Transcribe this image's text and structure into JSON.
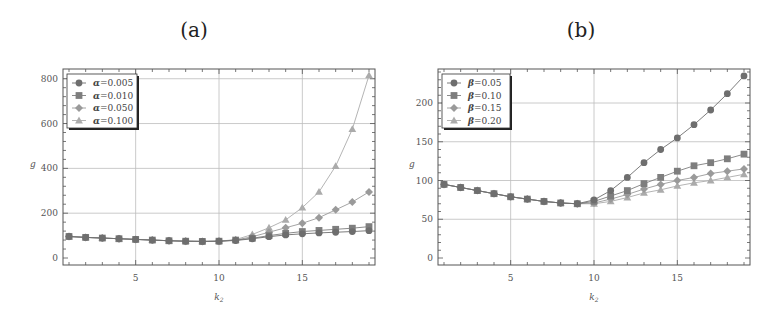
{
  "panels": [
    {
      "label": "(a)"
    },
    {
      "label": "(b)"
    }
  ],
  "chart_data": [
    {
      "type": "line",
      "title": "(a)",
      "xlabel": "k2",
      "ylabel": "g",
      "xlim": [
        1,
        19
      ],
      "ylim": [
        0,
        830
      ],
      "xticks": [
        5,
        10,
        15
      ],
      "yticks": [
        0,
        200,
        400,
        600,
        800
      ],
      "grid": true,
      "legend_position": "top-left",
      "x": [
        1,
        2,
        3,
        4,
        5,
        6,
        7,
        8,
        9,
        10,
        11,
        12,
        13,
        14,
        15,
        16,
        17,
        18,
        19
      ],
      "series": [
        {
          "name": "α=0.005",
          "marker": "circle",
          "values": [
            96,
            92,
            89,
            86,
            83,
            80,
            77,
            75,
            74,
            75,
            78,
            86,
            95,
            103,
            108,
            112,
            115,
            118,
            122
          ]
        },
        {
          "name": "α=0.010",
          "marker": "square",
          "values": [
            96,
            92,
            89,
            86,
            83,
            80,
            77,
            75,
            74,
            75,
            80,
            88,
            100,
            110,
            118,
            123,
            128,
            133,
            140
          ]
        },
        {
          "name": "α=0.050",
          "marker": "diamond",
          "values": [
            96,
            92,
            89,
            86,
            83,
            80,
            77,
            75,
            74,
            75,
            80,
            95,
            115,
            135,
            155,
            180,
            215,
            250,
            295
          ]
        },
        {
          "name": "α=0.100",
          "marker": "triangle",
          "values": [
            96,
            92,
            89,
            86,
            83,
            80,
            77,
            75,
            74,
            75,
            82,
            105,
            135,
            170,
            225,
            295,
            410,
            575,
            815
          ]
        }
      ]
    },
    {
      "type": "line",
      "title": "(b)",
      "xlabel": "k2",
      "ylabel": "g",
      "xlim": [
        1,
        19
      ],
      "ylim": [
        0,
        240
      ],
      "xticks": [
        5,
        10,
        15
      ],
      "yticks": [
        0,
        50,
        100,
        150,
        200
      ],
      "grid": true,
      "legend_position": "top-left",
      "x": [
        1,
        2,
        3,
        4,
        5,
        6,
        7,
        8,
        9,
        10,
        11,
        12,
        13,
        14,
        15,
        16,
        17,
        18,
        19
      ],
      "series": [
        {
          "name": "β=0.05",
          "marker": "circle",
          "values": [
            95,
            91,
            87,
            83,
            79,
            76,
            73,
            71,
            70,
            75,
            87,
            104,
            123,
            140,
            155,
            172,
            191,
            212,
            235
          ]
        },
        {
          "name": "β=0.10",
          "marker": "square",
          "values": [
            95,
            91,
            87,
            83,
            79,
            76,
            73,
            71,
            70,
            73,
            80,
            87,
            96,
            104,
            112,
            119,
            123,
            128,
            134
          ]
        },
        {
          "name": "β=0.15",
          "marker": "diamond",
          "values": [
            95,
            91,
            87,
            83,
            79,
            76,
            73,
            71,
            70,
            71,
            76,
            82,
            89,
            95,
            100,
            104,
            109,
            112,
            115
          ]
        },
        {
          "name": "β=0.20",
          "marker": "triangle",
          "values": [
            95,
            91,
            87,
            83,
            79,
            76,
            73,
            71,
            70,
            70,
            73,
            78,
            84,
            88,
            93,
            97,
            100,
            104,
            108
          ]
        }
      ]
    }
  ],
  "legends": [
    {
      "entries": [
        {
          "sym": "α",
          "val": "=0.005"
        },
        {
          "sym": "α",
          "val": "=0.010"
        },
        {
          "sym": "α",
          "val": "=0.050"
        },
        {
          "sym": "α",
          "val": "=0.100"
        }
      ]
    },
    {
      "entries": [
        {
          "sym": "β",
          "val": "=0.05"
        },
        {
          "sym": "β",
          "val": "=0.10"
        },
        {
          "sym": "β",
          "val": "=0.15"
        },
        {
          "sym": "β",
          "val": "=0.20"
        }
      ]
    }
  ],
  "colors": {
    "series": [
      "#6e6e6e",
      "#7e7e7e",
      "#9a9a9a",
      "#ababab"
    ],
    "grid": "#bdbdbd",
    "frame": "#555555"
  }
}
